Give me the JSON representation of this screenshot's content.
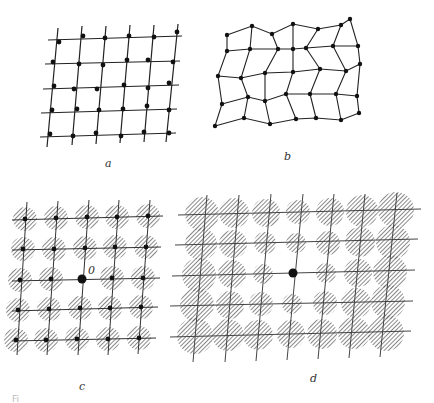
{
  "figure": {
    "panels": [
      {
        "id": "a",
        "label": "a",
        "description": "Regular square lattice with atoms displaced randomly from lattice sites (thermal disorder / first kind)"
      },
      {
        "id": "b",
        "label": "b",
        "description": "Distorted lattice network with cumulative displacement (disorder of the second kind)"
      },
      {
        "id": "c",
        "label": "c",
        "description": "Lattice with hatched smearing of equal size around each site; central reference atom",
        "origin_label": "0"
      },
      {
        "id": "d",
        "label": "d",
        "description": "Lattice with smearing growing with distance from central reference atom"
      }
    ],
    "caption_fragment": "Fi"
  },
  "colors": {
    "ink": "#222222",
    "hatch": "#555555",
    "background": "#ffffff"
  }
}
